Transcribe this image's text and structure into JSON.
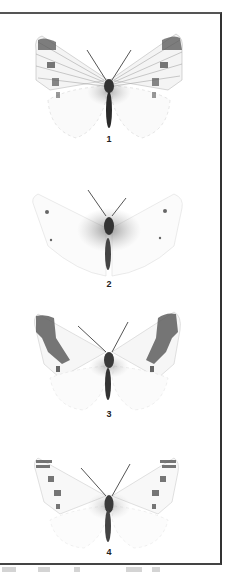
{
  "figure": {
    "type": "specimen-plate",
    "specimens": [
      {
        "label": "1",
        "pattern": "dark apex, two forewing spots, dark veins"
      },
      {
        "label": "2",
        "pattern": "pale, faint small spots"
      },
      {
        "label": "3",
        "pattern": "broad dark apical border band"
      },
      {
        "label": "4",
        "pattern": "dark apex, series of forewing spots"
      }
    ]
  },
  "colors": {
    "ink": "#222222",
    "border": "#444444",
    "background": "#ffffff"
  }
}
